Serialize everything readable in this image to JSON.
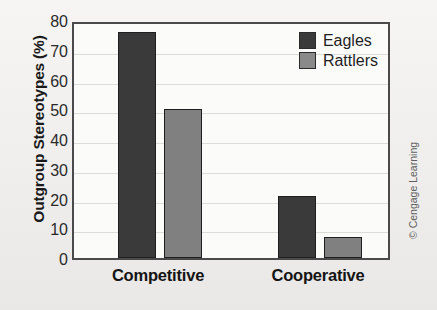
{
  "chart_data": {
    "type": "bar",
    "title": "",
    "xlabel": "",
    "ylabel": "Outgroup Stereotypes (%)",
    "ylim": [
      0,
      80
    ],
    "ytick_step": 10,
    "yticks": [
      80,
      70,
      60,
      50,
      40,
      30,
      20,
      10,
      0
    ],
    "grid": true,
    "legend_position": "top-right",
    "categories": [
      "Competitive",
      "Cooperative"
    ],
    "series": [
      {
        "name": "Eagles",
        "color": "#3a3a3a",
        "values": [
          76,
          21
        ]
      },
      {
        "name": "Rattlers",
        "color": "#808080",
        "values": [
          50,
          7
        ]
      }
    ]
  },
  "credit": {
    "text": "© Cengage Learning"
  }
}
